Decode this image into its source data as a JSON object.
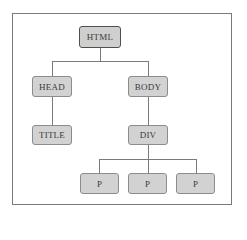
{
  "diagram": {
    "type": "tree",
    "title": "",
    "nodes": [
      {
        "id": "html",
        "label": "HTML",
        "parent": null
      },
      {
        "id": "head",
        "label": "HEAD",
        "parent": "html"
      },
      {
        "id": "body",
        "label": "BODY",
        "parent": "html"
      },
      {
        "id": "title",
        "label": "TITLE",
        "parent": "head"
      },
      {
        "id": "div",
        "label": "DIV",
        "parent": "body"
      },
      {
        "id": "p1",
        "label": "P",
        "parent": "div"
      },
      {
        "id": "p2",
        "label": "P",
        "parent": "div"
      },
      {
        "id": "p3",
        "label": "P",
        "parent": "div"
      }
    ],
    "labels": {
      "html": "HTML",
      "head": "HEAD",
      "body": "BODY",
      "title": "TITLE",
      "div": "DIV",
      "p1": "P",
      "p2": "P",
      "p3": "P"
    },
    "colors": {
      "node_fill": "#d2d2d2",
      "node_border": "#8c8c8c",
      "root_border": "#505050",
      "connector": "#7a7a7a",
      "frame_border": "#7a7a7a",
      "text": "#3a3a3a"
    }
  }
}
